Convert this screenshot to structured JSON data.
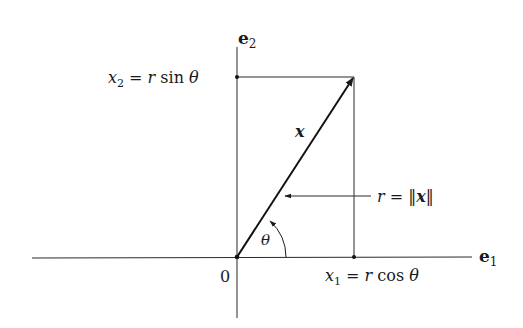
{
  "diagram": {
    "type": "polar-coordinates",
    "axes": {
      "horizontal_label": "e",
      "horizontal_sub": "1",
      "vertical_label": "e",
      "vertical_sub": "2",
      "origin_label": "0"
    },
    "vector": {
      "label": "x",
      "angle_label": "θ"
    },
    "projections": {
      "x2": {
        "var": "x",
        "sub": "2",
        "eq": " = ",
        "r": "r",
        "fn": " sin ",
        "theta": "θ"
      },
      "x1": {
        "var": "x",
        "sub": "1",
        "eq": " = ",
        "r": "r",
        "fn": " cos ",
        "theta": "θ"
      }
    },
    "magnitude": {
      "r": "r",
      "eq": " = ",
      "open": "‖",
      "var": "x",
      "close": "‖"
    },
    "colors": {
      "ink": "#1a1a1a",
      "background": "#ffffff"
    }
  }
}
